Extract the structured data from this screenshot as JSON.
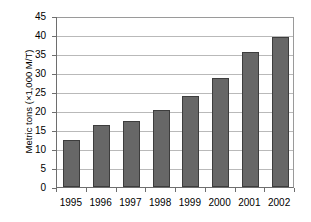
{
  "chart_data": {
    "type": "bar",
    "title": "",
    "xlabel": "",
    "ylabel": "Metric tons (×1,000 M/T)",
    "categories": [
      "1995",
      "1996",
      "1997",
      "1998",
      "1999",
      "2000",
      "2001",
      "2002"
    ],
    "values": [
      12.4,
      16.2,
      17.4,
      20.3,
      24.0,
      28.8,
      35.6,
      39.5
    ],
    "ylim": [
      0,
      45
    ],
    "ytick_step": 5,
    "yticks": [
      "0",
      "5",
      "10",
      "15",
      "20",
      "25",
      "30",
      "35",
      "40",
      "45"
    ],
    "grid": "horizontal",
    "legend": "none",
    "series": [
      {
        "name": "Metric tons",
        "values": [
          12.4,
          16.2,
          17.4,
          20.3,
          24.0,
          28.8,
          35.6,
          39.5
        ]
      }
    ],
    "colors": {
      "bar_fill": "#676767",
      "bar_edge": "#3d3d3d",
      "gridline": "#b9b9b9",
      "axis": "#6e6e6e",
      "background": "#ffffff",
      "text": "#000000"
    }
  }
}
